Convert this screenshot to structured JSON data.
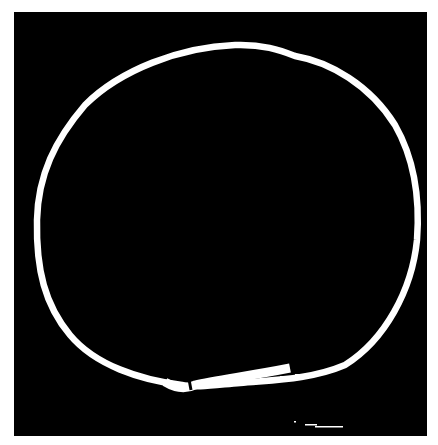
{
  "image": {
    "description": "White hand-drawn rough ring on black square background",
    "background_color": "#000000",
    "page_color": "#ffffff",
    "ring_color": "#ffffff",
    "frame": {
      "x": 14,
      "y": 12,
      "width": 413,
      "height": 424
    }
  }
}
